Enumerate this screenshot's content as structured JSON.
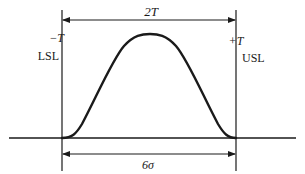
{
  "diagram": {
    "type": "process-capability-distribution",
    "colors": {
      "ink": "#1a1a1a",
      "background": "#ffffff"
    },
    "labels": {
      "tolerance_width": "2T",
      "lower_tolerance": "−T",
      "upper_tolerance": "+T",
      "lsl": "LSL",
      "usl": "USL",
      "process_spread": "6σ"
    },
    "dimensions": [
      {
        "name": "tolerance-width",
        "label": "2T",
        "from": "LSL",
        "to": "USL",
        "position": "top"
      },
      {
        "name": "process-spread",
        "label": "6σ",
        "from": "LSL",
        "to": "USL",
        "position": "bottom"
      }
    ],
    "curve": {
      "shape": "bell",
      "peak": "center",
      "starts_at": "LSL",
      "ends_at": "USL"
    }
  }
}
